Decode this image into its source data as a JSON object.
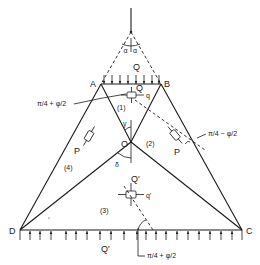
{
  "diagram": {
    "type": "slip-line field / stress zones under strip load",
    "points": {
      "A": "A",
      "B": "B",
      "C": "C",
      "D": "D",
      "O": "O"
    },
    "loads": {
      "top": "Q",
      "bottom": "Q'"
    },
    "zones": [
      "(1)",
      "(2)",
      "(3)",
      "(4)"
    ],
    "elements": {
      "zone1": {
        "normal": "Q",
        "tangent": "q"
      },
      "zone2": {
        "label": "P"
      },
      "zone3": {
        "normal": "Q'",
        "tangent": "q'"
      },
      "zone4": {
        "label": "P"
      }
    },
    "angles": {
      "alpha_left": "α",
      "alpha_right": "α",
      "gamma": "γ",
      "delta": "δ",
      "plus_label_top": "π/4 + φ/2",
      "minus_label": "π/4 − φ/2",
      "plus_label_bottom": "π/4 + φ/2"
    }
  }
}
